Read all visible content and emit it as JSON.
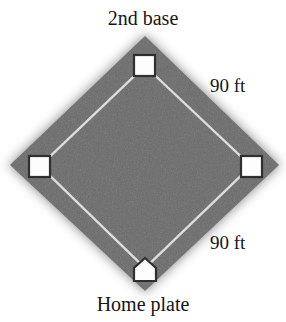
{
  "figure": {
    "width": 286,
    "height": 322,
    "background_color": "#ffffff"
  },
  "labels": {
    "second_base": "2nd base",
    "home_plate": "Home plate",
    "distance_right_upper": "90 ft",
    "distance_right_lower": "90 ft"
  },
  "diagram": {
    "shape": "diamond",
    "field_fill_color": "#6a6a6a",
    "field_edge_color": "#8d8d8d",
    "baseline_color": "#e8e8e8",
    "base_fill_color": "#fdfdfd",
    "base_outline_color": "#333333",
    "center": {
      "x": 145,
      "y": 165
    },
    "corners": {
      "top": {
        "x": 145,
        "y": 36
      },
      "right": {
        "x": 279,
        "y": 165
      },
      "bottom": {
        "x": 145,
        "y": 291
      },
      "left": {
        "x": 10,
        "y": 165
      }
    },
    "bases": [
      {
        "name": "2nd base",
        "marker": "square",
        "x": 145,
        "y": 66,
        "size": 20
      },
      {
        "name": "1st base",
        "marker": "square",
        "x": 251,
        "y": 166,
        "size": 20
      },
      {
        "name": "3rd base",
        "marker": "square",
        "x": 40,
        "y": 166,
        "size": 20
      },
      {
        "name": "Home plate",
        "marker": "pentagon",
        "x": 145,
        "y": 271,
        "size": 22
      }
    ],
    "baseline_distance": "90 ft"
  }
}
